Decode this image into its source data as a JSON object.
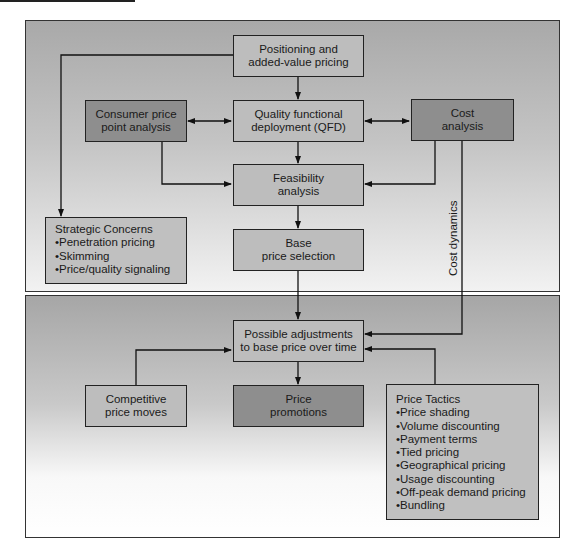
{
  "diagram": {
    "type": "pricing-process-flowchart",
    "panels": [
      "strategic-pricing",
      "tactical-pricing"
    ],
    "nodes": {
      "positioning": {
        "line1": "Positioning and",
        "line2": "added-value pricing"
      },
      "consumer_price": {
        "line1": "Consumer price",
        "line2": "point analysis"
      },
      "qfd": {
        "line1": "Quality functional",
        "line2": "deployment (QFD)"
      },
      "cost_analysis": {
        "line1": "Cost",
        "line2": "analysis"
      },
      "feasibility": {
        "line1": "Feasibility",
        "line2": "analysis"
      },
      "base_price": {
        "line1": "Base",
        "line2": "price selection"
      },
      "strategic_concerns": {
        "title": "Strategic Concerns",
        "items": [
          "Penetration pricing",
          "Skimming",
          "Price/quality signaling"
        ]
      },
      "possible_adjustments": {
        "line1": "Possible adjustments",
        "line2": "to base price over time"
      },
      "competitive_moves": {
        "line1": "Competitive",
        "line2": "price moves"
      },
      "price_promotions": {
        "line1": "Price",
        "line2": "promotions"
      },
      "price_tactics": {
        "title": "Price Tactics",
        "items": [
          "Price shading",
          "Volume discounting",
          "Payment terms",
          "Tied pricing",
          "Geographical pricing",
          "Usage discounting",
          "Off-peak demand pricing",
          "Bundling"
        ]
      }
    },
    "edge_labels": {
      "cost_dynamics": "Cost dynamics"
    },
    "edges": [
      {
        "from": "positioning",
        "to": "qfd"
      },
      {
        "from": "positioning",
        "to": "strategic_concerns"
      },
      {
        "from": "consumer_price",
        "to": "qfd",
        "bidirectional": true
      },
      {
        "from": "cost_analysis",
        "to": "qfd",
        "bidirectional": true
      },
      {
        "from": "qfd",
        "to": "feasibility"
      },
      {
        "from": "consumer_price",
        "to": "feasibility"
      },
      {
        "from": "cost_analysis",
        "to": "feasibility"
      },
      {
        "from": "feasibility",
        "to": "base_price"
      },
      {
        "from": "base_price",
        "to": "possible_adjustments"
      },
      {
        "from": "cost_analysis",
        "to": "possible_adjustments",
        "label": "Cost dynamics"
      },
      {
        "from": "competitive_moves",
        "to": "possible_adjustments"
      },
      {
        "from": "price_tactics",
        "to": "possible_adjustments"
      },
      {
        "from": "possible_adjustments",
        "to": "price_promotions"
      }
    ],
    "colors": {
      "light_box": "#bdbdbd",
      "dark_box": "#8e8e8e",
      "border": "#222222"
    }
  }
}
